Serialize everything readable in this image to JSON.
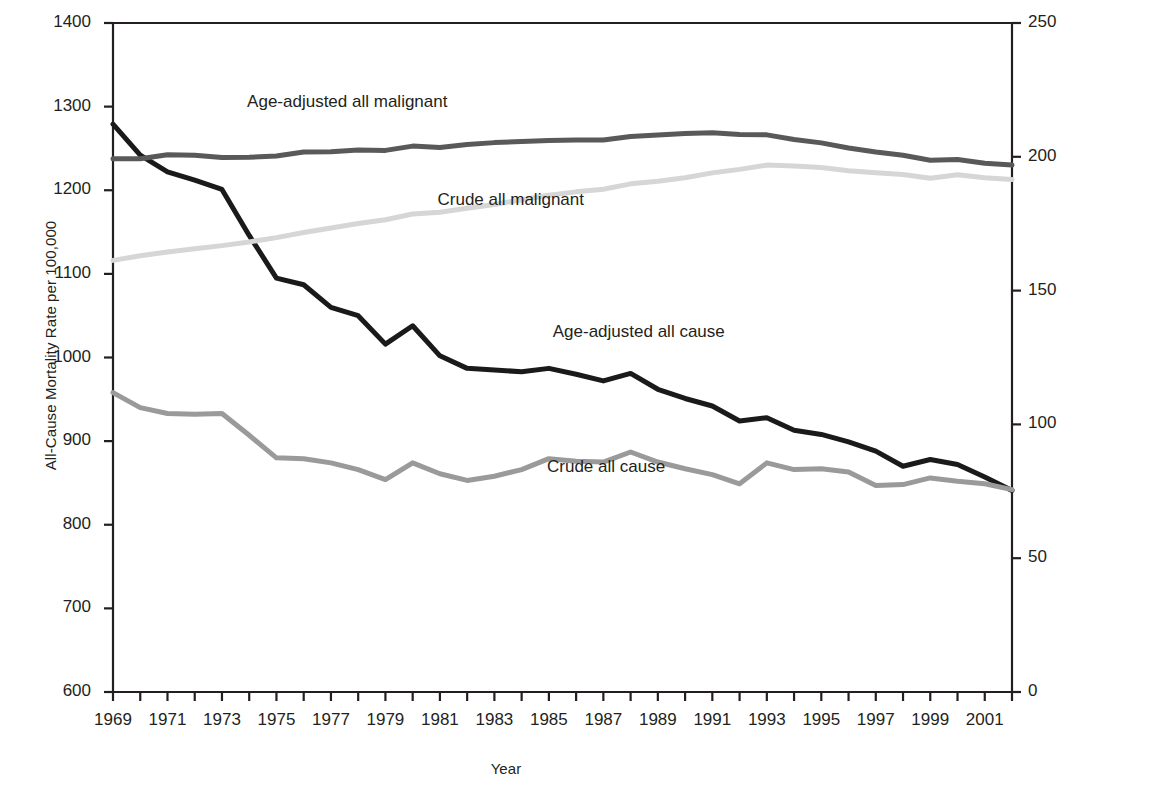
{
  "chart_data": {
    "type": "line",
    "title": "",
    "xlabel": "Year",
    "ylabel": "All-Cause Mortality Rate per 100,000",
    "ylabel_right": "",
    "xlim": [
      1969,
      2002
    ],
    "ylim": [
      600,
      1400
    ],
    "ylim_right": [
      0,
      250
    ],
    "grid": false,
    "legend": "inline-annotations",
    "x": [
      1969,
      1970,
      1971,
      1972,
      1973,
      1974,
      1975,
      1976,
      1977,
      1978,
      1979,
      1980,
      1981,
      1982,
      1983,
      1984,
      1985,
      1986,
      1987,
      1988,
      1989,
      1990,
      1991,
      1992,
      1993,
      1994,
      1995,
      1996,
      1997,
      1998,
      1999,
      2000,
      2001,
      2002
    ],
    "xticks": [
      1969,
      1970,
      1971,
      1972,
      1973,
      1974,
      1975,
      1976,
      1977,
      1978,
      1979,
      1980,
      1981,
      1982,
      1983,
      1984,
      1985,
      1986,
      1987,
      1988,
      1989,
      1990,
      1991,
      1992,
      1993,
      1994,
      1995,
      1996,
      1997,
      1998,
      1999,
      2000,
      2001,
      2002
    ],
    "xticklabels": [
      "1969",
      "",
      "1971",
      "",
      "1973",
      "",
      "1975",
      "",
      "1977",
      "",
      "1979",
      "",
      "1981",
      "",
      "1983",
      "",
      "1985",
      "",
      "1987",
      "",
      "1989",
      "",
      "1991",
      "",
      "1993",
      "",
      "1995",
      "",
      "1997",
      "",
      "1999",
      "",
      "2001",
      ""
    ],
    "yticks_left": [
      600,
      700,
      800,
      900,
      1000,
      1100,
      1200,
      1300,
      1400
    ],
    "yticklabels_left": [
      "600",
      "700",
      "800",
      "900",
      "1000",
      "1100",
      "1200",
      "1300",
      "1400"
    ],
    "yticks_right": [
      0,
      50,
      100,
      150,
      200,
      250
    ],
    "yticklabels_right": [
      "0",
      "50",
      "100",
      "150",
      "200",
      "250"
    ],
    "series": [
      {
        "name": "Age-adjusted all cause",
        "axis": "left",
        "color": "#1a1a1a",
        "width": 5,
        "label_x": 1988.3,
        "label_y": 1030,
        "values": [
          1279,
          1242,
          1222,
          1212,
          1201,
          1146,
          1095,
          1087,
          1060,
          1050,
          1016,
          1038,
          1002,
          987,
          985,
          983,
          987,
          980,
          972,
          981,
          962,
          951,
          942,
          924,
          928,
          913,
          908,
          899,
          888,
          870,
          878,
          872,
          857,
          841
        ]
      },
      {
        "name": "Crude all cause",
        "axis": "left",
        "color": "#9a9a9a",
        "width": 5,
        "label_x": 1987.1,
        "label_y": 869,
        "values": [
          958,
          940,
          933,
          932,
          933,
          907,
          880,
          879,
          874,
          866,
          854,
          874,
          861,
          853,
          858,
          866,
          879,
          876,
          875,
          887,
          875,
          867,
          860,
          849,
          874,
          866,
          867,
          863,
          847,
          848,
          856,
          852,
          849,
          842
        ]
      },
      {
        "name": "Age-adjusted all malignant",
        "axis": "right",
        "color": "#595959",
        "width": 5,
        "label_x": 1977.6,
        "label_y": 1306,
        "values": [
          199.3,
          199.3,
          200.8,
          200.6,
          199.7,
          199.8,
          200.3,
          201.8,
          201.9,
          202.5,
          202.4,
          204.0,
          203.5,
          204.6,
          205.3,
          205.7,
          206.1,
          206.3,
          206.3,
          207.6,
          208.1,
          208.7,
          209.0,
          208.3,
          208.2,
          206.5,
          205.2,
          203.3,
          201.8,
          200.6,
          198.7,
          199.0,
          197.6,
          196.9
        ]
      },
      {
        "name": "Crude all malignant",
        "axis": "right",
        "color": "#d6d6d6",
        "width": 5,
        "label_x": 1983.6,
        "label_y": 1188,
        "values": [
          161.3,
          163.0,
          164.4,
          165.6,
          166.8,
          168.2,
          169.8,
          171.7,
          173.4,
          175.1,
          176.5,
          178.6,
          179.3,
          180.8,
          182.2,
          183.9,
          185.6,
          186.9,
          187.9,
          189.9,
          190.9,
          192.2,
          194.0,
          195.3,
          196.9,
          196.6,
          196.0,
          194.8,
          194.0,
          193.4,
          192.0,
          193.3,
          192.2,
          191.5
        ]
      }
    ]
  }
}
